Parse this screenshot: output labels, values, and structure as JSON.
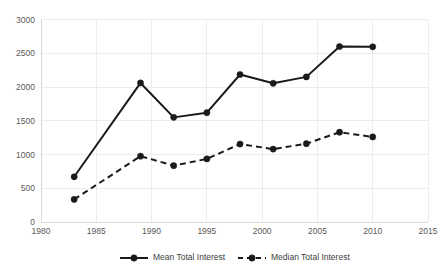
{
  "chart_data": {
    "type": "line",
    "title": "",
    "subtitle": "",
    "xlabel": "",
    "ylabel": "",
    "xlim": [
      1980,
      2015
    ],
    "ylim": [
      0,
      3000
    ],
    "grid": true,
    "legend_position": "bottom",
    "x": [
      1983,
      1989,
      1992,
      1995,
      1998,
      2001,
      2004,
      2007,
      2010
    ],
    "xticks": [
      "1980",
      "1985",
      "1990",
      "1995",
      "2000",
      "2005",
      "2010",
      "2015"
    ],
    "xtick_values": [
      1980,
      1985,
      1990,
      1995,
      2000,
      2005,
      2010,
      2015
    ],
    "yticks": [
      "0",
      "500",
      "1000",
      "1500",
      "2000",
      "2500",
      "3000"
    ],
    "ytick_values": [
      0,
      500,
      1000,
      1500,
      2000,
      2500,
      3000
    ],
    "series": [
      {
        "name": "Mean Total Interest",
        "style": "solid",
        "marker": "circle",
        "color": "#1a1a1a",
        "values": [
          670,
          2060,
          1550,
          1620,
          2185,
          2055,
          2150,
          2600,
          2595
        ]
      },
      {
        "name": "Median Total Interest",
        "style": "dashed",
        "marker": "circle",
        "color": "#1a1a1a",
        "values": [
          335,
          975,
          835,
          935,
          1155,
          1080,
          1160,
          1330,
          1260
        ]
      }
    ],
    "annotations": []
  },
  "legend": {
    "items": [
      {
        "label": "Mean Total Interest"
      },
      {
        "label": "Median Total Interest"
      }
    ]
  }
}
